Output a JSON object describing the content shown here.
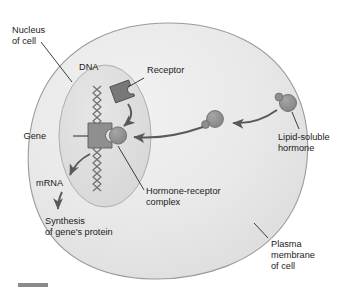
{
  "figure": {
    "background_color": "#ffffff"
  },
  "colors": {
    "cell_fill": "#e8e8e8",
    "cell_stroke": "#9a9a9a",
    "nucleus_fill": "#dedede",
    "nucleus_stroke": "#a8a8a8",
    "molecule_fill": "#8c8c8c",
    "molecule_stroke": "#6a6a6a",
    "gene_fill": "#8f8f8f",
    "receptor_fill": "#777777",
    "arrow_color": "#595959",
    "leader_color": "#2a2a2a",
    "text_color": "#1b1b1b",
    "scale_bar": "#8a8a8a"
  },
  "labels": {
    "nucleus": {
      "line1": "Nucleus",
      "line2": "of cell"
    },
    "dna": {
      "line1": "DNA"
    },
    "receptor": {
      "line1": "Receptor"
    },
    "gene": {
      "line1": "Gene"
    },
    "mrna": {
      "line1": "mRNA"
    },
    "synthesis": {
      "line1": "Synthesis",
      "line2": "of gene's protein"
    },
    "complex": {
      "line1": "Hormone-receptor",
      "line2": "complex"
    },
    "hormone": {
      "line1": "Lipid-soluble",
      "line2": "hormone"
    },
    "plasma_membrane": {
      "line1": "Plasma",
      "line2": "membrane",
      "line3": "of cell"
    }
  },
  "structures": {
    "cell": "plasma-membrane-blob",
    "nucleus": "nucleus-ellipse",
    "dna": "dna-double-helix-zigzag",
    "gene_box": "gene-segment-with-binding-notch",
    "receptor": "free-receptor-protein",
    "hormone_outside": "lipid-soluble-hormone-extracellular",
    "hormone_crossing": "lipid-soluble-hormone-crossing-membrane",
    "hormone_bound": "hormone-bound-at-gene"
  },
  "arrows": {
    "hormone_entry": "hormone diffuses through plasma membrane toward nucleus",
    "receptor_binding": "receptor moves down to bind hormone at gene",
    "transcription": "gene transcribed into mRNA",
    "translation": "mRNA directs synthesis of gene's protein"
  }
}
